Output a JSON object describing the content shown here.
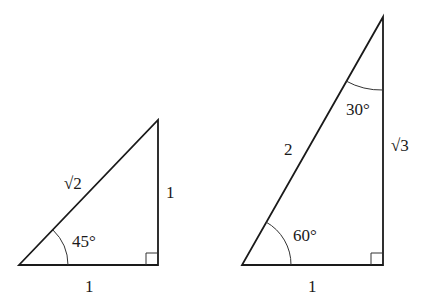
{
  "diagram": {
    "triangle_45": {
      "hypotenuse_label": "√2",
      "vertical_leg_label": "1",
      "base_label": "1",
      "angle_label": "45°"
    },
    "triangle_30_60": {
      "hypotenuse_label": "2",
      "vertical_leg_label": "√3",
      "base_label": "1",
      "top_angle_label": "30°",
      "bottom_angle_label": "60°"
    },
    "colors": {
      "stroke": "#1a1a1a",
      "background": "#ffffff"
    }
  }
}
